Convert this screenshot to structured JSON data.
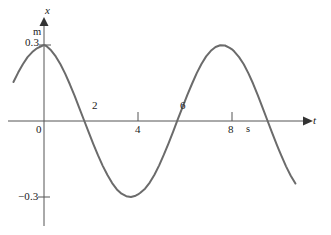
{
  "figure": {
    "background_color": "#ffffff",
    "curve_color": "#6b6b6b",
    "axis_color": "#555555",
    "text_color": "#1a1a1a"
  },
  "axes": {
    "vertical": {
      "name": "x",
      "unit": "m",
      "tick_positive": "0.3",
      "tick_negative": "−0.3"
    },
    "horizontal": {
      "name": "t",
      "unit": "s",
      "ticks": [
        "0",
        "2",
        "4",
        "6",
        "8"
      ]
    }
  },
  "chart_data": {
    "type": "line",
    "title": "",
    "xlabel": "t",
    "ylabel": "x",
    "xunit": "s",
    "yunit": "m",
    "grid": false,
    "legend": null,
    "xlim": [
      -1.3,
      10.8
    ],
    "ylim": [
      -0.42,
      0.42
    ],
    "xticks": [
      0,
      2,
      4,
      6,
      8
    ],
    "xticklabels": [
      "0",
      "2",
      "4",
      "6",
      "8"
    ],
    "yticks": [
      0.3,
      -0.3
    ],
    "yticklabels": [
      "0.3",
      "−0.3"
    ],
    "amplitude": 0.3,
    "period": 8,
    "equation": "x = 0.3 cos(2πt/8)",
    "series": [
      {
        "name": "displacement",
        "color": "#6b6b6b",
        "x": [
          -1.3,
          -1.1,
          -0.9,
          -0.7,
          -0.5,
          -0.3,
          -0.1,
          0.0,
          0.1,
          0.3,
          0.5,
          0.7,
          0.9,
          1.1,
          1.3,
          1.5,
          1.7,
          1.9,
          2.0,
          2.1,
          2.3,
          2.5,
          2.7,
          2.9,
          3.1,
          3.3,
          3.5,
          3.7,
          3.9,
          4.0,
          4.1,
          4.3,
          4.5,
          4.7,
          4.9,
          5.1,
          5.3,
          5.5,
          5.7,
          5.9,
          6.0,
          6.1,
          6.3,
          6.5,
          6.7,
          6.9,
          7.1,
          7.3,
          7.5,
          7.7,
          7.9,
          8.0,
          8.1,
          8.3,
          8.5,
          8.7,
          8.9,
          9.1,
          9.3,
          9.5,
          9.7,
          9.9,
          10.0,
          10.1,
          10.3,
          10.5,
          10.7
        ],
        "y": [
          0.154,
          0.191,
          0.224,
          0.252,
          0.272,
          0.287,
          0.296,
          0.3,
          0.296,
          0.279,
          0.255,
          0.224,
          0.187,
          0.145,
          0.1,
          0.052,
          0.004,
          -0.044,
          -0.068,
          -0.091,
          -0.136,
          -0.177,
          -0.213,
          -0.245,
          -0.27,
          -0.287,
          -0.297,
          -0.3,
          -0.295,
          -0.29,
          -0.283,
          -0.267,
          -0.243,
          -0.212,
          -0.175,
          -0.133,
          -0.088,
          -0.041,
          0.008,
          0.056,
          0.079,
          0.103,
          0.147,
          0.189,
          0.225,
          0.255,
          0.277,
          0.292,
          0.299,
          0.298,
          0.289,
          0.283,
          0.274,
          0.252,
          0.224,
          0.188,
          0.147,
          0.101,
          0.053,
          0.004,
          -0.045,
          -0.092,
          -0.115,
          -0.137,
          -0.179,
          -0.216,
          -0.247
        ]
      }
    ]
  }
}
